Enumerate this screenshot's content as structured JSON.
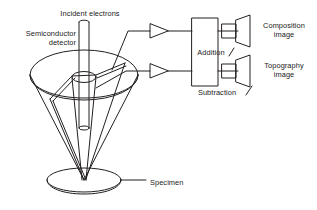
{
  "figure": {
    "background_color": "#ffffff",
    "stroke_color": "#231f20",
    "text_color": "#1a1a1a"
  },
  "labels": {
    "incident_electrons": "Incident electrons",
    "semiconductor_detector": "Semiconductor\ndetector",
    "addition": "Addition",
    "subtraction": "Subtraction",
    "composition_image": "Composition\nimage",
    "topography_image": "Topography\nimage",
    "specimen": "Specimen"
  },
  "components": {
    "beam_column": "incident-electron-beam",
    "detector_disc": "split-semiconductor-detector-disc",
    "detector_cone": "detector-collection-cone",
    "specimen_puck": "specimen-stage-disc",
    "amplifiers": [
      {
        "name": "amplifier-top",
        "signal": "detector-segment-a"
      },
      {
        "name": "amplifier-bottom",
        "signal": "detector-segment-b"
      }
    ],
    "processing_box": {
      "name": "signal-processing-unit",
      "operations": [
        "Addition",
        "Subtraction"
      ]
    },
    "displays": [
      {
        "name": "display-composition",
        "label": "Composition image"
      },
      {
        "name": "display-topography",
        "label": "Topography image"
      }
    ]
  }
}
